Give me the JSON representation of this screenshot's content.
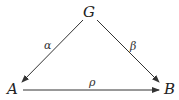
{
  "nodes": {
    "G": "G",
    "A": "A",
    "B": "B"
  },
  "edges": [
    {
      "from": "G",
      "to": "A",
      "label": "α"
    },
    {
      "from": "G",
      "to": "B",
      "label": "β"
    },
    {
      "from": "A",
      "to": "B",
      "label": "ρ"
    }
  ],
  "colors": {
    "stroke": "#333333"
  }
}
